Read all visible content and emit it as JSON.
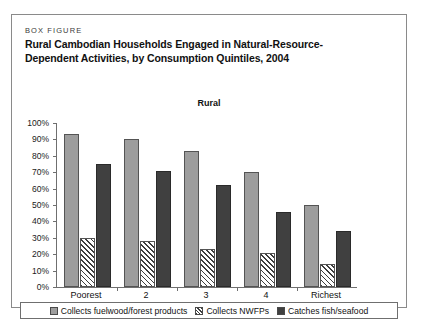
{
  "figure": {
    "kicker": "BOX FIGURE",
    "title_line1": "Rural Cambodian Households Engaged in Natural-Resource-",
    "title_line2": "Dependent Activities, by Consumption Quintiles, 2004"
  },
  "colors": {
    "series_fuelwood": "#9d9d9d",
    "series_nwfp": "#ffffff",
    "series_fish": "#404040",
    "axis": "#6f6f6f",
    "border": "#8a8a8a"
  },
  "legend": {
    "items": [
      {
        "label": "Collects fuelwood/forest products",
        "swatch": "solid-gray-swatch"
      },
      {
        "label": "Collects NWFPs",
        "swatch": "hatched-swatch"
      },
      {
        "label": "Catches fish/seafood",
        "swatch": "solid-dark-swatch"
      }
    ]
  },
  "chart_data": {
    "type": "bar",
    "title": "Rural",
    "xlabel": "",
    "ylabel": "",
    "ylim": [
      0,
      100
    ],
    "grid": false,
    "legend_position": "bottom",
    "categories": [
      "Poorest",
      "2",
      "3",
      "4",
      "Richest"
    ],
    "ytick_labels": [
      "100%",
      "90%",
      "80%",
      "70%",
      "60%",
      "50%",
      "40%",
      "30%",
      "20%",
      "10%",
      "0%"
    ],
    "ytick_values": [
      100,
      90,
      80,
      70,
      60,
      50,
      40,
      30,
      20,
      10,
      0
    ],
    "series": [
      {
        "name": "Collects fuelwood/forest products",
        "values": [
          93,
          90,
          83,
          70,
          50
        ]
      },
      {
        "name": "Collects NWFPs",
        "values": [
          30,
          28,
          23,
          21,
          14
        ]
      },
      {
        "name": "Catches fish/seafood",
        "values": [
          75,
          71,
          62,
          46,
          34
        ]
      }
    ]
  }
}
